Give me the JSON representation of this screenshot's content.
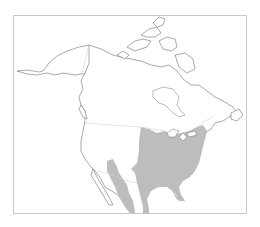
{
  "map": {
    "type": "species-range-map",
    "region": "North America",
    "caption_visible_text": "",
    "frame": {
      "border_color": "#c8c8c8",
      "background": "#ffffff"
    },
    "colors": {
      "land": "#ffffff",
      "coastline": "#555555",
      "political_borders": "#d0d0d0",
      "range_fill": "#bdbdbd"
    },
    "shaded_range": {
      "description": "Eastern and central United States from the Great Plains to the Atlantic coast, south to the Gulf Coast and Florida, with narrow extensions into northeastern Mexico and a separate band along the Sierra Madre Occidental / southwestern US",
      "areas": [
        "Eastern United States",
        "Gulf Coast",
        "Florida",
        "Eastern Mexico (narrow band)",
        "Southwestern US / western Mexico (separate band)"
      ]
    }
  }
}
